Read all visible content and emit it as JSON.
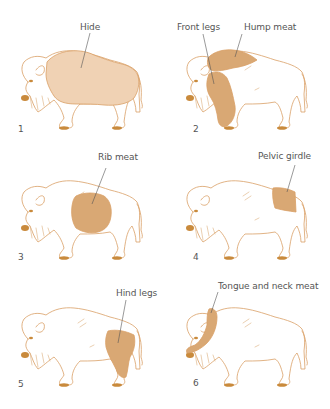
{
  "colors": {
    "outline": "#d9a066",
    "hide_fill": "#f0d2b4",
    "meat_fill": "#d9a874",
    "hoof": "#c98a3c",
    "label_text": "#555555"
  },
  "panels": [
    {
      "number": "1",
      "label": "Hide",
      "part": "hide"
    },
    {
      "number": "2",
      "label": "Front legs",
      "label2": "Hump meat",
      "part": "front-legs-hump"
    },
    {
      "number": "3",
      "label": "Rib meat",
      "part": "rib"
    },
    {
      "number": "4",
      "label": "Pelvic girdle",
      "part": "pelvic"
    },
    {
      "number": "5",
      "label": "Hind legs",
      "part": "hind-legs"
    },
    {
      "number": "6",
      "label": "Tongue and neck meat",
      "part": "tongue-neck"
    }
  ]
}
